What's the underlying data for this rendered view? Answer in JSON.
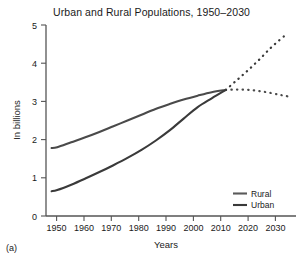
{
  "figure": {
    "caption": "(a)"
  },
  "chart_data": {
    "type": "line",
    "title": "Urban and Rural Populations, 1950–2030",
    "xlabel": "Years",
    "ylabel": "In billions",
    "xlim": [
      1946,
      2035
    ],
    "ylim": [
      0,
      5
    ],
    "xticks": [
      1950,
      1960,
      1970,
      1980,
      1990,
      2000,
      2010,
      2020,
      2030
    ],
    "xticklabels": [
      "1950",
      "1960",
      "1970",
      "1980",
      "1990",
      "2000",
      "2010",
      "2020",
      "2030"
    ],
    "yticks": [
      0,
      1,
      2,
      3,
      4,
      5
    ],
    "yticklabels": [
      "0",
      "1",
      "2",
      "3",
      "4",
      "5"
    ],
    "grid": false,
    "legend_position": "lower right",
    "units": "billions of people",
    "series": [
      {
        "name": "Rural",
        "color": "#4a4a4a",
        "linestyle": "solid",
        "x": [
          1948,
          1950,
          1955,
          1960,
          1965,
          1970,
          1975,
          1980,
          1985,
          1990,
          1995,
          2000,
          2005,
          2010
        ],
        "values": [
          1.78,
          1.8,
          1.93,
          2.06,
          2.2,
          2.35,
          2.5,
          2.65,
          2.8,
          2.93,
          3.05,
          3.15,
          3.24,
          3.3
        ]
      },
      {
        "name": "Rural",
        "color": "#4a4a4a",
        "linestyle": "dotted",
        "projection": true,
        "x": [
          2010,
          2014,
          2018,
          2022,
          2026,
          2030,
          2033
        ],
        "values": [
          3.3,
          3.31,
          3.3,
          3.27,
          3.22,
          3.16,
          3.12
        ]
      },
      {
        "name": "Urban",
        "color": "#3a3a3a",
        "linestyle": "solid",
        "x": [
          1948,
          1950,
          1955,
          1960,
          1965,
          1970,
          1975,
          1980,
          1985,
          1990,
          1995,
          2000,
          2005,
          2010
        ],
        "values": [
          0.65,
          0.68,
          0.82,
          0.98,
          1.15,
          1.33,
          1.52,
          1.73,
          1.97,
          2.24,
          2.55,
          2.85,
          3.08,
          3.3
        ]
      },
      {
        "name": "Urban",
        "color": "#3a3a3a",
        "linestyle": "dotted",
        "projection": true,
        "x": [
          2010,
          2014,
          2018,
          2022,
          2026,
          2030,
          2031
        ],
        "values": [
          3.3,
          3.56,
          3.82,
          4.1,
          4.4,
          4.66,
          4.72
        ]
      }
    ],
    "legend": [
      {
        "label": "Rural",
        "color": "#5a5a5a"
      },
      {
        "label": "Urban",
        "color": "#3a3a3a"
      }
    ]
  }
}
